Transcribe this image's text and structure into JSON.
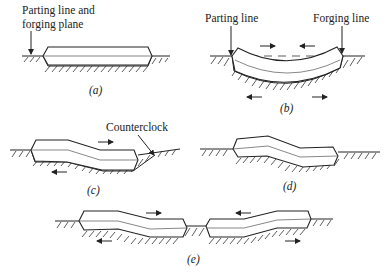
{
  "figure": {
    "panels": [
      {
        "id": "a",
        "caption": "(a)",
        "labels": [
          "Parting line and",
          "forging plane"
        ]
      },
      {
        "id": "b",
        "caption": "(b)",
        "labels": [
          "Parting line",
          "Forging line"
        ]
      },
      {
        "id": "c",
        "caption": "(c)",
        "labels": [
          "Counterclock"
        ]
      },
      {
        "id": "d",
        "caption": "(d)",
        "labels": []
      },
      {
        "id": "e",
        "caption": "(e)",
        "labels": []
      }
    ]
  },
  "a": {
    "label_line1": "Parting line and",
    "label_line2": "forging plane",
    "caption": "(a)"
  },
  "b": {
    "label_left": "Parting line",
    "label_right": "Forging line",
    "caption": "(b)"
  },
  "c": {
    "label": "Counterclock",
    "caption": "(c)"
  },
  "d": {
    "caption": "(d)"
  },
  "e": {
    "caption": "(e)"
  },
  "colors": {
    "ink": "#222222",
    "background": "#ffffff"
  }
}
